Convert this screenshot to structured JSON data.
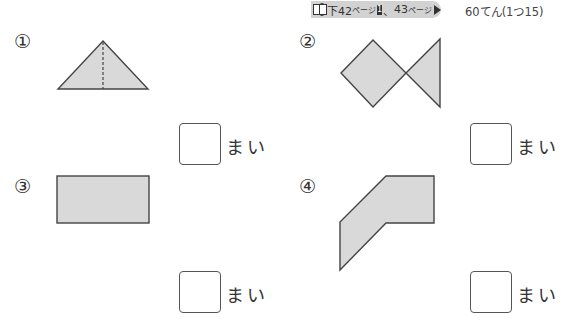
{
  "header": {
    "ref": {
      "book_icon": "book-icon",
      "textbook_badge": "教",
      "part1_prefix": "下42",
      "part1_suffix": "ページ",
      "badge1": "1",
      "sep": "、",
      "part2_prefix": "43",
      "part2_suffix": "ページ",
      "end_icon": "play-triangle-icon"
    },
    "points": "60てん(1つ15)"
  },
  "questions": [
    {
      "number": "①",
      "shape": "isosceles-triangle-with-dashed-center-line",
      "answer": "",
      "unit": "まい"
    },
    {
      "number": "②",
      "shape": "fish-square-and-triangle",
      "answer": "",
      "unit": "まい"
    },
    {
      "number": "③",
      "shape": "rectangle",
      "answer": "",
      "unit": "まい"
    },
    {
      "number": "④",
      "shape": "bent-hexagon",
      "answer": "",
      "unit": "まい"
    }
  ],
  "colors": {
    "shape_fill": "#d9d9d9",
    "shape_stroke": "#444444",
    "ref_band": "#d2d2d2"
  }
}
